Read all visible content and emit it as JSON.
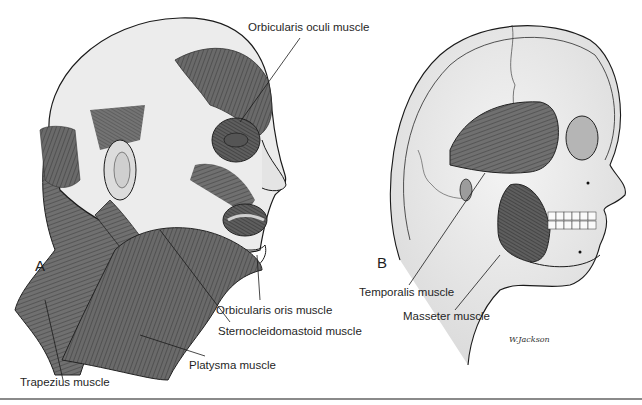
{
  "figure": {
    "panels": [
      {
        "id": "A",
        "letter": "A",
        "subject": "head-with-facial-and-neck-muscles",
        "labels": {
          "orbicularis_oculi": "Orbicularis oculi muscle",
          "orbicularis_oris": "Orbicularis oris muscle",
          "sternocleidomastoid": "Sternocleidomastoid muscle",
          "platysma": "Platysma muscle",
          "trapezius": "Trapezius muscle"
        }
      },
      {
        "id": "B",
        "letter": "B",
        "subject": "skull-with-muscles-of-mastication",
        "labels": {
          "temporalis": "Temporalis muscle",
          "masseter": "Masseter muscle"
        },
        "signature": "W.Jackson"
      }
    ],
    "colors": {
      "muscle": "#6e6e6e",
      "muscle_dark": "#4a4a4a",
      "skin": "#e9e9e9",
      "outline": "#1a1a1a",
      "background": "#ffffff",
      "rule": "#8a8a8a"
    }
  }
}
